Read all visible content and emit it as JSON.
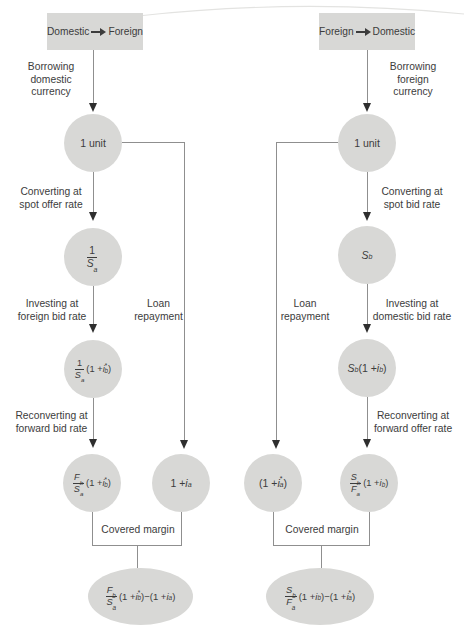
{
  "theme": {
    "bg": "#ffffff",
    "node_fill": "#d8d8d6",
    "line_color": "#8f8f8f",
    "arrow_color": "#2e2e2e",
    "text_color": "#3c3c3c"
  },
  "left": {
    "header": {
      "from": "Domestic",
      "to": "Foreign"
    },
    "labels": {
      "borrow": "Borrowing domestic currency",
      "convert": "Converting at spot offer rate",
      "invest": "Investing at foreign bid rate",
      "loan": "Loan repayment",
      "reconvert": "Reconverting at forward bid rate",
      "covered_margin": "Covered margin"
    },
    "nodes": {
      "unit": "1 unit",
      "after_spot": "[1/S_a]",
      "after_invest": "[1/S_a](1 + i^*_b)",
      "after_forward": "[F_b/S_a](1 + i^*_b)",
      "loan_repay": "1 + i_a",
      "covered_margin_result": "[F_b/S_a](1 + i^*_b)−(1 + i_a)"
    }
  },
  "right": {
    "header": {
      "from": "Foreign",
      "to": "Domestic"
    },
    "labels": {
      "borrow": "Borrowing foreign currency",
      "convert": "Converting at spot bid rate",
      "invest": "Investing at domestic bid rate",
      "loan": "Loan repayment",
      "reconvert": "Reconverting at forward offer rate",
      "covered_margin": "Covered margin"
    },
    "nodes": {
      "unit": "1 unit",
      "after_spot": "S_b",
      "after_invest": "S_b(1 + i_b)",
      "loan_repay": "(1 + i^*_a)",
      "after_forward": "[S_b/F_a](1 + i_b)",
      "covered_margin_result": "[S_b/F_a](1 + i_b)−(1 + i^*_a)"
    }
  }
}
